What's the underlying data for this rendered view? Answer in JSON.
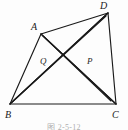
{
  "figure": {
    "caption": "图 2-5-12",
    "background_color": "#fdfdfd",
    "stroke_color": "#1a1a1a",
    "vertices": [
      {
        "name": "A",
        "label": "A",
        "x": 41,
        "y": 34,
        "label_x": 31,
        "label_y": 22
      },
      {
        "name": "B",
        "label": "B",
        "x": 10,
        "y": 104,
        "label_x": 5,
        "label_y": 110
      },
      {
        "name": "C",
        "label": "C",
        "x": 116,
        "y": 104,
        "label_x": 112,
        "label_y": 110
      },
      {
        "name": "D",
        "label": "D",
        "x": 108,
        "y": 13,
        "label_x": 100,
        "label_y": 1
      }
    ],
    "interior_points": [
      {
        "name": "Q",
        "label": "Q",
        "x": 50,
        "y": 67,
        "label_x": 40,
        "label_y": 57
      },
      {
        "name": "P",
        "label": "P",
        "x": 83,
        "y": 68,
        "label_x": 87,
        "label_y": 57
      }
    ],
    "segments": [
      {
        "name": "side-AB",
        "from": "A",
        "to": "B"
      },
      {
        "name": "side-BC",
        "from": "B",
        "to": "C"
      },
      {
        "name": "side-CD",
        "from": "C",
        "to": "D"
      },
      {
        "name": "side-AD",
        "from": "A",
        "to": "D"
      },
      {
        "name": "diagonal-AC",
        "from": "A",
        "to": "C"
      },
      {
        "name": "diagonal-BD",
        "from": "B",
        "to": "D"
      },
      {
        "name": "cevian-AP-to-C",
        "from": "A",
        "to": "C"
      },
      {
        "name": "cevian-DQ-to-B",
        "from": "D",
        "to": "B"
      },
      {
        "name": "cevian-B-to-P-D",
        "from": "B",
        "to": "D"
      },
      {
        "name": "cevian-C-to-Q-A",
        "from": "C",
        "to": "A"
      }
    ]
  },
  "lines": [
    {
      "name": "segment-A-B",
      "x1": 41,
      "y1": 34,
      "x2": 10,
      "y2": 104
    },
    {
      "name": "segment-B-C",
      "x1": 10,
      "y1": 104,
      "x2": 116,
      "y2": 104
    },
    {
      "name": "segment-C-D",
      "x1": 116,
      "y1": 104,
      "x2": 108,
      "y2": 13
    },
    {
      "name": "segment-A-D",
      "x1": 41,
      "y1": 34,
      "x2": 108,
      "y2": 13
    },
    {
      "name": "segment-A-C",
      "x1": 41,
      "y1": 34,
      "x2": 116,
      "y2": 104
    },
    {
      "name": "segment-B-D",
      "x1": 10,
      "y1": 104,
      "x2": 108,
      "y2": 13
    },
    {
      "name": "segment-A-P-C",
      "x1": 41,
      "y1": 34,
      "x2": 111,
      "y2": 101
    },
    {
      "name": "segment-D-Q-B",
      "x1": 108,
      "y1": 13,
      "x2": 12,
      "y2": 102
    },
    {
      "name": "segment-B-P-D",
      "x1": 10,
      "y1": 104,
      "x2": 106,
      "y2": 16
    },
    {
      "name": "segment-C-Q-A",
      "x1": 116,
      "y1": 104,
      "x2": 43,
      "y2": 36
    }
  ]
}
